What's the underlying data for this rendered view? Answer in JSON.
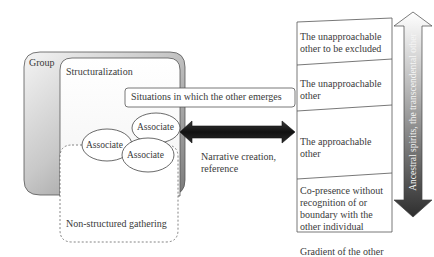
{
  "left_cluster": {
    "group_label": "Group",
    "structuralization_label": "Structuralization",
    "situations_label": "Situations in which the other emerges",
    "associates": [
      "Associate",
      "Associate",
      "Associate"
    ],
    "non_structured_label": "Non-structured gathering"
  },
  "connector": {
    "label_line1": "Narrative creation,",
    "label_line2": "reference"
  },
  "gradient_column": {
    "levels": [
      {
        "line1": "The unapproachable",
        "line2": "other to be excluded"
      },
      {
        "line1": "The unapproachable",
        "line2": "other"
      },
      {
        "line1": "The approachable",
        "line2": "other"
      },
      {
        "line1": "Co-presence without",
        "line2": "recognition of or",
        "line3": "boundary with the",
        "line4": "other individual"
      }
    ],
    "caption": "Gradient of the other",
    "arrow_label": "Ancestral spirits, the transcendental other"
  },
  "colors": {
    "group_gradient_light": "#f2f2f2",
    "group_gradient_dark": "#8c8c8c",
    "arrow_dark": "#1a1a1a",
    "line": "#555555"
  }
}
